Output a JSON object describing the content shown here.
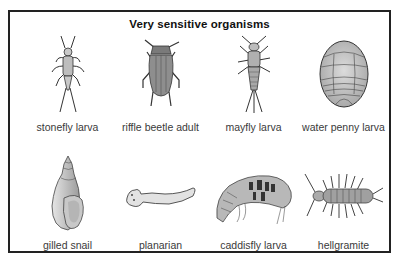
{
  "panel": {
    "title": "Very sensitive organisms"
  },
  "organisms": [
    {
      "row": 1,
      "col": 1,
      "label": "stonefly larva",
      "icon": "stonefly-larva-icon"
    },
    {
      "row": 1,
      "col": 2,
      "label": "riffle beetle adult",
      "icon": "riffle-beetle-icon"
    },
    {
      "row": 1,
      "col": 3,
      "label": "mayfly larva",
      "icon": "mayfly-larva-icon"
    },
    {
      "row": 1,
      "col": 4,
      "label": "water penny larva",
      "icon": "water-penny-icon"
    },
    {
      "row": 2,
      "col": 1,
      "label": "gilled snail",
      "icon": "gilled-snail-icon"
    },
    {
      "row": 2,
      "col": 2,
      "label": "planarian",
      "icon": "planarian-icon"
    },
    {
      "row": 2,
      "col": 3,
      "label": "caddisfly larva",
      "icon": "caddisfly-larva-icon"
    },
    {
      "row": 2,
      "col": 4,
      "label": "hellgramite",
      "icon": "hellgramite-icon"
    }
  ],
  "colors": {
    "border": "#222222",
    "illustration_fill": "#bdbdbd",
    "illustration_stroke": "#333333",
    "label_text": "#3a3a3a"
  }
}
